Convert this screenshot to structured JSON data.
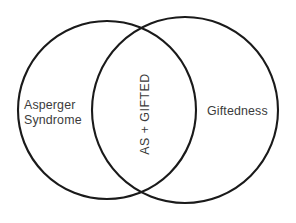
{
  "figure": {
    "type": "venn-diagram",
    "background_color": "#ffffff",
    "stroke_color": "#1a1a1a",
    "text_color": "#3b3b3b",
    "width": 296,
    "height": 223
  },
  "sets": {
    "left": {
      "label_line1": "Asperger",
      "label_line2": "Syndrome",
      "center_x": 107,
      "center_y": 110,
      "radius": 89
    },
    "right": {
      "label": "Giftedness",
      "center_x": 185,
      "center_y": 110,
      "radius": 93
    },
    "intersection": {
      "label": "AS + GIFTED",
      "rotation_degrees": -90,
      "center_x": 145,
      "center_y": 114
    }
  }
}
